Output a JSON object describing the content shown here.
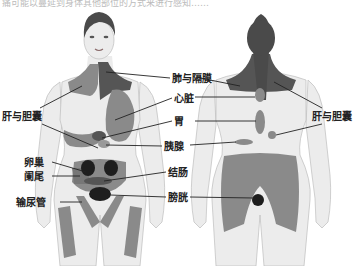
{
  "caption": "痛可能以蔓延到身体其他部位的方式来进行感知……",
  "colors": {
    "skin": "#ececec",
    "skin_outline": "#bdbdbd",
    "zone_medium": "#8a8a8a",
    "zone_dark": "#555555",
    "organ_darkest": "#1e1e1e",
    "hair": "#4a4a4a",
    "leader_line": "#222222"
  },
  "front_figure": {
    "labels": [
      {
        "id": "lung-diaphragm",
        "text": "肺与隔膜"
      },
      {
        "id": "heart",
        "text": "心脏"
      },
      {
        "id": "liver-gallbladder",
        "text": "肝与胆囊"
      },
      {
        "id": "stomach",
        "text": "胃"
      },
      {
        "id": "pancreas",
        "text": "胰腺"
      },
      {
        "id": "ovary",
        "text": "卵巢"
      },
      {
        "id": "appendix",
        "text": "阑尾"
      },
      {
        "id": "colon",
        "text": "结肠"
      },
      {
        "id": "ureter",
        "text": "输尿管"
      },
      {
        "id": "bladder",
        "text": "膀胱"
      }
    ]
  },
  "back_figure": {
    "labels": [
      {
        "id": "liver-gallbladder-back",
        "text": "肝与胆囊"
      }
    ]
  }
}
